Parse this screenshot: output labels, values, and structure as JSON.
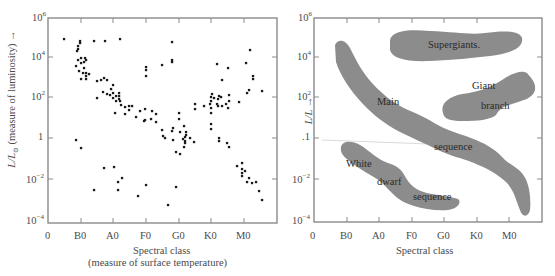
{
  "chart_data": [
    {
      "type": "scatter",
      "title": "",
      "xlabel": "Spectral class",
      "xlabel_sub": "(measure of surface temperature)",
      "ylabel": "L/L⊙ (measure of luminosity) →",
      "x_tick_labels": [
        "0",
        "B0",
        "A0",
        "F0",
        "G0",
        "K0",
        "M0"
      ],
      "y_tick_labels": [
        "10^6",
        "10^4",
        "10^2",
        "1",
        "10^-2",
        "10^-4"
      ],
      "ylim": [
        0.0001,
        1000000
      ],
      "yscale": "log",
      "grid": false,
      "legend": null,
      "points_px_note": "points given as [x_px, y_px] in image coordinates",
      "points": [
        [
          64,
          39
        ],
        [
          80,
          41
        ],
        [
          80,
          43
        ],
        [
          78,
          46
        ],
        [
          78,
          49
        ],
        [
          77,
          51
        ],
        [
          94,
          41
        ],
        [
          105,
          41
        ],
        [
          120,
          39
        ],
        [
          172,
          42
        ],
        [
          81,
          58
        ],
        [
          85,
          58
        ],
        [
          78,
          60
        ],
        [
          86,
          60
        ],
        [
          76,
          66
        ],
        [
          81,
          63
        ],
        [
          84,
          62
        ],
        [
          79,
          71
        ],
        [
          84,
          68
        ],
        [
          83,
          73
        ],
        [
          86,
          73
        ],
        [
          86,
          76
        ],
        [
          89,
          74
        ],
        [
          86,
          79
        ],
        [
          81,
          79
        ],
        [
          97,
          81
        ],
        [
          101,
          80
        ],
        [
          104,
          78
        ],
        [
          107,
          80
        ],
        [
          97,
          98
        ],
        [
          103,
          92
        ],
        [
          107,
          94
        ],
        [
          110,
          95
        ],
        [
          111,
          89
        ],
        [
          113,
          85
        ],
        [
          113,
          93
        ],
        [
          113,
          98
        ],
        [
          116,
          96
        ],
        [
          119,
          96
        ],
        [
          119,
          93
        ],
        [
          119,
          99
        ],
        [
          116,
          101
        ],
        [
          120,
          101
        ],
        [
          121,
          105
        ],
        [
          125,
          107
        ],
        [
          115,
          113
        ],
        [
          125,
          114
        ],
        [
          129,
          110
        ],
        [
          129,
          106
        ],
        [
          132,
          106
        ],
        [
          140,
          111
        ],
        [
          136,
          117
        ],
        [
          145,
          109
        ],
        [
          152,
          111
        ],
        [
          144,
          121
        ],
        [
          156,
          114
        ],
        [
          146,
          67
        ],
        [
          146,
          70
        ],
        [
          146,
          76
        ],
        [
          162,
          65
        ],
        [
          172,
          62
        ],
        [
          172,
          60
        ],
        [
          145,
          120
        ],
        [
          151,
          119
        ],
        [
          156,
          122
        ],
        [
          162,
          130
        ],
        [
          163,
          136
        ],
        [
          165,
          138
        ],
        [
          172,
          131
        ],
        [
          173,
          140
        ],
        [
          173,
          128
        ],
        [
          179,
          113
        ],
        [
          179,
          119
        ],
        [
          180,
          132
        ],
        [
          183,
          139
        ],
        [
          185,
          137
        ],
        [
          185,
          141
        ],
        [
          190,
          138
        ],
        [
          176,
          152
        ],
        [
          180,
          154
        ],
        [
          184,
          147
        ],
        [
          185,
          143
        ],
        [
          186,
          135
        ],
        [
          184,
          126
        ],
        [
          186,
          132
        ],
        [
          194,
          142
        ],
        [
          195,
          104
        ],
        [
          195,
          109
        ],
        [
          204,
          106
        ],
        [
          210,
          104
        ],
        [
          211,
          113
        ],
        [
          211,
          108
        ],
        [
          211,
          101
        ],
        [
          211,
          97
        ],
        [
          212,
          94
        ],
        [
          214,
          98
        ],
        [
          217,
          104
        ],
        [
          218,
          106
        ],
        [
          218,
          99
        ],
        [
          219,
          96
        ],
        [
          221,
          97
        ],
        [
          222,
          106
        ],
        [
          226,
          104
        ],
        [
          228,
          108
        ],
        [
          229,
          101
        ],
        [
          229,
          95
        ],
        [
          217,
          64
        ],
        [
          228,
          68
        ],
        [
          222,
          80
        ],
        [
          239,
          102
        ],
        [
          246,
          63
        ],
        [
          250,
          50
        ],
        [
          253,
          79
        ],
        [
          253,
          76
        ],
        [
          249,
          90
        ],
        [
          247,
          93
        ],
        [
          262,
          91
        ],
        [
          211,
          124
        ],
        [
          211,
          129
        ],
        [
          219,
          138
        ],
        [
          219,
          141
        ],
        [
          227,
          143
        ],
        [
          229,
          147
        ],
        [
          242,
          163
        ],
        [
          237,
          166
        ],
        [
          242,
          169
        ],
        [
          242,
          173
        ],
        [
          242,
          176
        ],
        [
          245,
          171
        ],
        [
          249,
          178
        ],
        [
          247,
          182
        ],
        [
          252,
          183
        ],
        [
          256,
          182
        ],
        [
          259,
          191
        ],
        [
          262,
          200
        ],
        [
          76,
          140
        ],
        [
          81,
          148
        ],
        [
          104,
          168
        ],
        [
          114,
          167
        ],
        [
          118,
          182
        ],
        [
          122,
          178
        ],
        [
          118,
          190
        ],
        [
          138,
          196
        ],
        [
          146,
          185
        ],
        [
          176,
          187
        ],
        [
          168,
          205
        ],
        [
          94,
          190
        ]
      ]
    },
    {
      "type": "diagram-regions",
      "title": "",
      "xlabel": "Spectral class",
      "ylabel": "L/L →",
      "x_tick_labels": [
        "0",
        "B0",
        "A0",
        "F0",
        "G0",
        "K0",
        "M0"
      ],
      "y_tick_labels": [
        "10^6",
        "10^4",
        "10^2",
        ".1",
        "10^-2",
        "10^-4"
      ],
      "yscale": "log",
      "grid": false,
      "regions": [
        {
          "name": "Supergiants",
          "label": "Supergiants."
        },
        {
          "name": "Giant branch",
          "label_line1": "Giant",
          "label_line2": "branch"
        },
        {
          "name": "Main sequence",
          "label_line1": "Main",
          "label_line2": "sequence"
        },
        {
          "name": "White dwarf sequence",
          "label_line1": "White",
          "label_line2": "dwarf",
          "label_line3": "sequence"
        }
      ],
      "region_color": "#8c8c8c"
    }
  ],
  "left": {
    "ylabel_main": "L/L",
    "ylabel_sub": "⊙",
    "ylabel_rest": " (measure of luminosity) →",
    "xlabel": "Spectral class",
    "xlabel_sub": "(measure of surface temperature)"
  },
  "right": {
    "ylabel": "L/L  →",
    "xlabel": "Spectral class",
    "labels": {
      "supergiants": "Supergiants.",
      "giant": "Giant",
      "branch": "branch",
      "main": "Main",
      "sequence": "sequence",
      "white": "White",
      "dwarf": "dwarf",
      "wd_sequence": "sequence"
    }
  },
  "colors": {
    "axis": "#7a7a7a",
    "dot": "#1a1a1a",
    "region": "#8c8c8c",
    "text": "#4a4a4a"
  }
}
